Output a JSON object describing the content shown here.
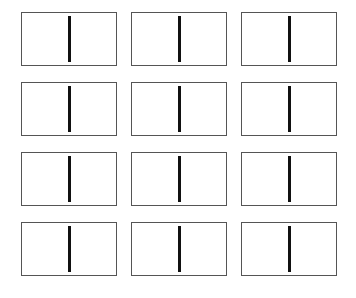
{
  "diagram": {
    "rows": 4,
    "columns": 3,
    "cells": [
      {
        "id": 1,
        "divider": "vertical"
      },
      {
        "id": 2,
        "divider": "vertical"
      },
      {
        "id": 3,
        "divider": "vertical"
      },
      {
        "id": 4,
        "divider": "vertical"
      },
      {
        "id": 5,
        "divider": "vertical"
      },
      {
        "id": 6,
        "divider": "vertical"
      },
      {
        "id": 7,
        "divider": "vertical"
      },
      {
        "id": 8,
        "divider": "vertical"
      },
      {
        "id": 9,
        "divider": "vertical"
      },
      {
        "id": 10,
        "divider": "vertical"
      },
      {
        "id": 11,
        "divider": "vertical"
      },
      {
        "id": 12,
        "divider": "vertical"
      }
    ],
    "colors": {
      "border": "#555555",
      "divider": "#111111",
      "background": "#ffffff"
    }
  }
}
